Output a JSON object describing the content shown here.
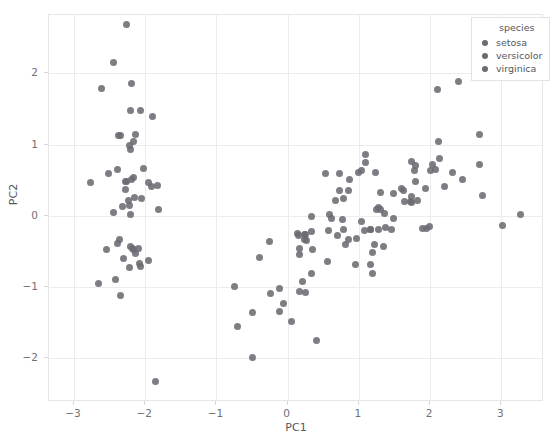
{
  "chart_data": {
    "type": "scatter",
    "title": "",
    "xlabel": "PC1",
    "ylabel": "PC2",
    "xlim": [
      -3.35,
      3.6
    ],
    "ylim": [
      -2.62,
      2.82
    ],
    "xticks": [
      -3,
      -2,
      -1,
      0,
      1,
      2,
      3
    ],
    "yticks": [
      -2,
      -1,
      0,
      1,
      2
    ],
    "xtick_labels": [
      "−3",
      "−2",
      "−1",
      "0",
      "1",
      "2",
      "3"
    ],
    "ytick_labels": [
      "−2",
      "−1",
      "0",
      "1",
      "2"
    ],
    "grid": true,
    "legend": {
      "position": "upper right",
      "title": "species",
      "entries": [
        {
          "label": "setosa",
          "color": "#6b6b73"
        },
        {
          "label": "versicolor",
          "color": "#6b6b73"
        },
        {
          "label": "virginica",
          "color": "#6b6b73"
        }
      ]
    },
    "marker": {
      "shape": "circle",
      "size": 7,
      "color": "#6b6b73",
      "opacity": 0.88
    },
    "series": [
      {
        "name": "setosa",
        "points": [
          [
            -2.26,
            0.48
          ],
          [
            -2.08,
            -0.67
          ],
          [
            -2.36,
            -0.34
          ],
          [
            -2.3,
            -0.6
          ],
          [
            -2.39,
            0.65
          ],
          [
            -2.07,
            1.48
          ],
          [
            -2.44,
            0.05
          ],
          [
            -2.23,
            0.22
          ],
          [
            -2.34,
            -1.12
          ],
          [
            -2.18,
            -0.46
          ],
          [
            -2.16,
            1.04
          ],
          [
            -2.32,
            0.13
          ],
          [
            -2.22,
            -0.73
          ],
          [
            -2.65,
            -0.96
          ],
          [
            -2.19,
            1.86
          ],
          [
            -2.26,
            2.69
          ],
          [
            -2.2,
            1.48
          ],
          [
            -2.19,
            0.51
          ],
          [
            -1.9,
            1.4
          ],
          [
            -2.34,
            1.13
          ],
          [
            -1.91,
            0.41
          ],
          [
            -2.2,
            0.93
          ],
          [
            -2.77,
            0.46
          ],
          [
            -1.82,
            0.09
          ],
          [
            -2.22,
            0.14
          ],
          [
            -1.95,
            -0.63
          ],
          [
            -2.05,
            0.24
          ],
          [
            -2.17,
            0.53
          ],
          [
            -2.28,
            0.37
          ],
          [
            -2.16,
            -0.47
          ],
          [
            -2.14,
            -0.53
          ],
          [
            -1.83,
            0.42
          ],
          [
            -2.61,
            1.79
          ],
          [
            -2.44,
            2.15
          ],
          [
            -2.2,
            -0.43
          ],
          [
            -2.1,
            -0.46
          ],
          [
            -2.03,
            0.67
          ],
          [
            -2.51,
            0.59
          ],
          [
            -2.42,
            -0.9
          ],
          [
            -2.15,
            0.26
          ],
          [
            -2.27,
            0.48
          ],
          [
            -1.86,
            -2.33
          ],
          [
            -2.55,
            -0.48
          ],
          [
            -1.96,
            0.47
          ],
          [
            -2.13,
            1.14
          ],
          [
            -2.07,
            -0.71
          ],
          [
            -2.38,
            1.12
          ],
          [
            -2.39,
            -0.39
          ],
          [
            -2.22,
            0.99
          ],
          [
            -2.2,
            0.01
          ]
        ]
      },
      {
        "name": "versicolor",
        "points": [
          [
            1.1,
            0.86
          ],
          [
            0.73,
            0.59
          ],
          [
            1.24,
            0.61
          ],
          [
            0.41,
            -1.75
          ],
          [
            1.08,
            -0.21
          ],
          [
            -0.39,
            -0.59
          ],
          [
            1.09,
            0.75
          ],
          [
            -0.75,
            -1.0
          ],
          [
            0.79,
            0.24
          ],
          [
            -0.24,
            -1.09
          ],
          [
            -0.5,
            -2.0
          ],
          [
            0.59,
            0.02
          ],
          [
            0.06,
            -1.49
          ],
          [
            0.79,
            -0.19
          ],
          [
            -0.26,
            -0.37
          ],
          [
            0.87,
            0.51
          ],
          [
            0.14,
            -0.25
          ],
          [
            0.21,
            -0.93
          ],
          [
            1.19,
            -0.81
          ],
          [
            0.17,
            -1.07
          ],
          [
            0.73,
            0.35
          ],
          [
            0.25,
            -0.27
          ],
          [
            1.22,
            -0.41
          ],
          [
            0.62,
            -0.04
          ],
          [
            0.67,
            0.22
          ],
          [
            0.86,
            0.35
          ],
          [
            1.25,
            0.08
          ],
          [
            1.0,
            0.6
          ],
          [
            0.33,
            -0.01
          ],
          [
            -0.12,
            -1.35
          ],
          [
            -0.12,
            -1.03
          ],
          [
            -0.06,
            -1.23
          ],
          [
            0.17,
            -0.46
          ],
          [
            1.35,
            -0.43
          ],
          [
            0.33,
            -0.22
          ],
          [
            0.53,
            0.59
          ],
          [
            1.04,
            0.64
          ],
          [
            0.81,
            -0.41
          ],
          [
            0.23,
            -0.27
          ],
          [
            0.25,
            -1.08
          ],
          [
            0.33,
            -0.82
          ],
          [
            0.77,
            -0.05
          ],
          [
            0.17,
            -0.54
          ],
          [
            -0.7,
            -1.56
          ],
          [
            0.35,
            -0.48
          ],
          [
            0.15,
            -0.28
          ],
          [
            0.23,
            -0.33
          ],
          [
            0.58,
            -0.21
          ],
          [
            -0.49,
            -1.36
          ],
          [
            0.27,
            -0.35
          ]
        ]
      },
      {
        "name": "virginica",
        "points": [
          [
            1.8,
            0.71
          ],
          [
            1.17,
            -0.19
          ],
          [
            2.45,
            0.51
          ],
          [
            1.27,
            -0.19
          ],
          [
            1.82,
            0.22
          ],
          [
            3.27,
            0.02
          ],
          [
            0.56,
            -0.65
          ],
          [
            2.74,
            0.28
          ],
          [
            1.95,
            -0.18
          ],
          [
            2.4,
            1.89
          ],
          [
            1.6,
            0.38
          ],
          [
            1.46,
            -0.19
          ],
          [
            1.94,
            0.38
          ],
          [
            0.95,
            -0.68
          ],
          [
            1.28,
            0.12
          ],
          [
            1.78,
            0.64
          ],
          [
            1.74,
            0.19
          ],
          [
            2.67,
            1.95
          ],
          [
            3.02,
            -0.14
          ],
          [
            1.17,
            -0.69
          ],
          [
            2.03,
            0.72
          ],
          [
            0.96,
            -0.32
          ],
          [
            2.7,
            0.72
          ],
          [
            1.48,
            -0.04
          ],
          [
            1.79,
            0.48
          ],
          [
            2.12,
            1.04
          ],
          [
            1.37,
            -0.16
          ],
          [
            1.31,
            0.08
          ],
          [
            1.99,
            -0.15
          ],
          [
            2.31,
            0.6
          ],
          [
            2.7,
            1.14
          ],
          [
            2.11,
            1.78
          ],
          [
            1.9,
            -0.18
          ],
          [
            1.36,
            0.03
          ],
          [
            1.19,
            -0.52
          ],
          [
            2.13,
            0.81
          ],
          [
            1.74,
            0.76
          ],
          [
            1.3,
            0.32
          ],
          [
            1.03,
            -0.08
          ],
          [
            1.74,
            0.27
          ],
          [
            2.2,
            0.41
          ],
          [
            1.64,
            0.2
          ],
          [
            1.17,
            -0.19
          ],
          [
            2.07,
            0.65
          ],
          [
            2.0,
            0.63
          ],
          [
            1.62,
            0.35
          ],
          [
            0.7,
            -0.28
          ],
          [
            1.73,
            0.2
          ],
          [
            1.48,
            0.31
          ],
          [
            0.86,
            -0.33
          ]
        ]
      }
    ]
  }
}
